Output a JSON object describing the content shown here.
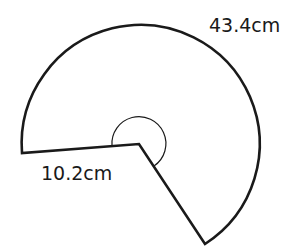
{
  "diagram": {
    "type": "circular-sector (major sector)",
    "shape": {
      "center": [
        139,
        144
      ],
      "radius_px": 119,
      "left_radius_end": [
        22,
        153
      ],
      "lower_radius_end": [
        205,
        244
      ],
      "stroke_color": "#1a1a1a",
      "fill_color": "#ffffff"
    },
    "angle_marker": {
      "radius_px": 27,
      "description": "reflex angle marker at center"
    },
    "labels": {
      "arc_length": "43.4cm",
      "radius": "10.2cm"
    }
  }
}
